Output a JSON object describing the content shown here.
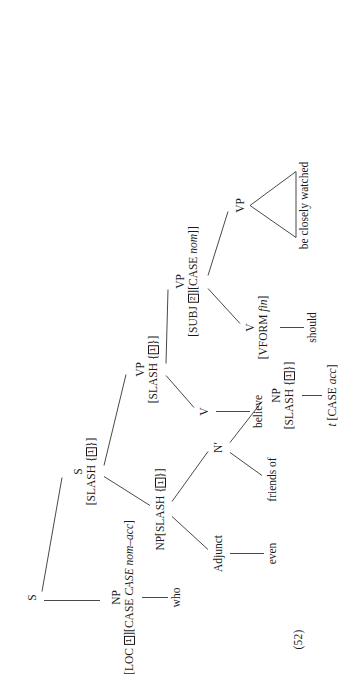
{
  "figure": {
    "example_number": "(52)",
    "caption": "",
    "type": "syntax-tree",
    "rotation_degrees": -90,
    "orientation_note": "figure rendered rotated 90 degrees counter-clockwise on the page"
  },
  "nodes": [
    {
      "id": "S-root",
      "category": "S",
      "features": "",
      "x": 60,
      "y": 28
    },
    {
      "id": "NP-who",
      "category": "NP",
      "features": "[LOC ①][CASE nom–acc]",
      "feature_parts": [
        "[LOC ",
        "1",
        "][CASE ",
        "nom–acc",
        "]"
      ],
      "x": 60,
      "y": 112
    },
    {
      "id": "S-slash",
      "category": "S",
      "features": "[SLASH {①}]",
      "x": 186,
      "y": 74
    },
    {
      "id": "NP-slash",
      "category": "NP[SLASH {①}]",
      "features": "",
      "x": 148,
      "y": 160
    },
    {
      "id": "Adjunct",
      "category": "Adjunct",
      "features": "",
      "x": 104,
      "y": 218
    },
    {
      "id": "Nbar",
      "category": "N′",
      "features": "",
      "x": 210,
      "y": 218
    },
    {
      "id": "NP-trace",
      "category": "NP",
      "features": "[SLASH {①}]",
      "x": 262,
      "y": 272
    },
    {
      "id": "VP-slash",
      "category": "VP",
      "features": "[SLASH {①}]",
      "x": 288,
      "y": 136
    },
    {
      "id": "V-believe",
      "category": "V",
      "features": "",
      "x": 246,
      "y": 204
    },
    {
      "id": "VP-subj",
      "category": "VP",
      "features": "[SUBJ ②][CASE nom]]",
      "x": 376,
      "y": 178
    },
    {
      "id": "V-should",
      "category": "V",
      "features": "[VFORM fin]",
      "x": 330,
      "y": 250
    },
    {
      "id": "VP-watched",
      "category": "VP",
      "features": "",
      "x": 452,
      "y": 238
    }
  ],
  "leaves": [
    {
      "id": "who",
      "text": "who",
      "x": 60,
      "y": 176,
      "italic": false
    },
    {
      "id": "even",
      "text": "even",
      "x": 104,
      "y": 272,
      "italic": false
    },
    {
      "id": "friends-of",
      "text": "friends of",
      "x": 178,
      "y": 272,
      "italic": false
    },
    {
      "id": "trace",
      "text": "t [CASE acc]",
      "x": 262,
      "y": 330,
      "italic": false
    },
    {
      "id": "believe",
      "text": "believe",
      "x": 246,
      "y": 258,
      "italic": false
    },
    {
      "id": "should",
      "text": "should",
      "x": 330,
      "y": 312,
      "italic": false
    },
    {
      "id": "be-closely-watched",
      "text": "be closely watched",
      "x": 452,
      "y": 302,
      "italic": false
    }
  ],
  "labels": {
    "boxed_index_1": "1",
    "boxed_index_2": "2",
    "trace_symbol": "t",
    "case_acc": "CASE acc",
    "case_nom": "CASE nom",
    "case_nom_acc": "CASE nom–acc",
    "vform_fin": "VFORM fin",
    "slash": "SLASH",
    "loc": "LOC",
    "subj": "SUBJ"
  },
  "colors": {
    "background": "#ffffff",
    "ink": "#1a1a1a",
    "line": "#1a1a1a"
  }
}
